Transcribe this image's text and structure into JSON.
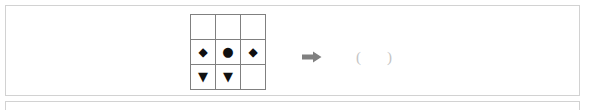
{
  "document": {
    "type": "matrix-reasoning-question",
    "panel_border_color": "#d2d2d2",
    "grid_line_color": "#808080",
    "symbol_color": "#111111",
    "arrow_color": "#808080",
    "answer_text_color": "#c8c8c8"
  },
  "matrix": {
    "rows": 3,
    "columns": 3,
    "cells": [
      [
        {
          "symbol": "",
          "icon": "empty-cell"
        },
        {
          "symbol": "",
          "icon": "empty-cell"
        },
        {
          "symbol": "",
          "icon": "empty-cell"
        }
      ],
      [
        {
          "symbol": "◆",
          "icon": "filled-diamond"
        },
        {
          "symbol": "●",
          "icon": "filled-circle"
        },
        {
          "symbol": "◆",
          "icon": "filled-diamond"
        }
      ],
      [
        {
          "symbol": "▼",
          "icon": "filled-down-triangle"
        },
        {
          "symbol": "▼",
          "icon": "filled-down-triangle"
        },
        {
          "symbol": "",
          "icon": "empty-cell"
        }
      ]
    ]
  },
  "arrow": {
    "icon": "right-arrow-icon",
    "direction": "right"
  },
  "answer": {
    "open_paren": "(",
    "blank": " ",
    "close_paren": ")",
    "value": ""
  }
}
